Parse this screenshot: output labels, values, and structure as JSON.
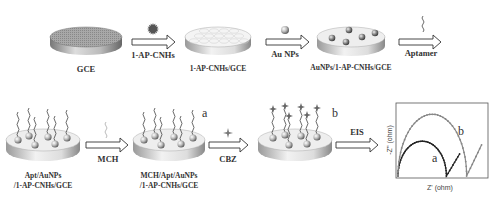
{
  "figure": {
    "steps": [
      {
        "id": "gce",
        "label": "GCE"
      },
      {
        "id": "cnh",
        "label": "1-AP-CNHs/GCE"
      },
      {
        "id": "au",
        "label": "AuNPs/1-AP-CNHs/GCE"
      },
      {
        "id": "apt",
        "label_line1": "Apt/AuNPs",
        "label_line2": "/1-AP-CNHs/GCE"
      },
      {
        "id": "mch",
        "label_line1": "MCH/Apt/AuNPs",
        "label_line2": "/1-AP-CNHs/GCE",
        "tag": "a"
      },
      {
        "id": "cbz",
        "tag": "b"
      }
    ],
    "arrows": [
      {
        "id": "arrow-cnhs",
        "label": "1-AP-CNHs",
        "reagent_icon": "sea-urchin-icon"
      },
      {
        "id": "arrow-aunps",
        "label": "Au NPs",
        "reagent_icon": "sphere-icon"
      },
      {
        "id": "arrow-aptamer",
        "label": "Aptamer",
        "reagent_icon": "squiggle-icon"
      },
      {
        "id": "arrow-mch",
        "label": "MCH",
        "reagent_icon": "squiggle-icon"
      },
      {
        "id": "arrow-cbz",
        "label": "CBZ",
        "reagent_icon": "star-icon"
      },
      {
        "id": "arrow-eis",
        "label": "EIS"
      }
    ],
    "inset_plot": {
      "type": "line",
      "xlabel": "Z' (ohm)",
      "ylabel": "-Z'' (ohm)",
      "series": [
        {
          "name": "a",
          "color": "#222222",
          "semicircle_diameter": 0.55,
          "tail_end": 0.7
        },
        {
          "name": "b",
          "color": "#888888",
          "semicircle_diameter": 0.78,
          "tail_end": 0.95
        }
      ]
    }
  }
}
